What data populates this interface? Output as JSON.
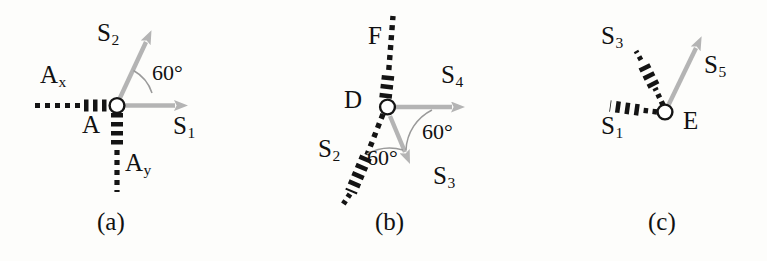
{
  "figure": {
    "background_color": "#fdfdfb",
    "arrow_color": "#b4b4b4",
    "dash_color": "#141414",
    "text_color": "#111111"
  },
  "panels": [
    {
      "id": "a",
      "caption": "(a)",
      "joint_label": "A",
      "angle_label": "60°",
      "members": [
        {
          "name": "S",
          "sub": "1",
          "style": "solid-gray-arrow",
          "direction": "right"
        },
        {
          "name": "S",
          "sub": "2",
          "style": "solid-gray-arrow",
          "direction": "up-right-60"
        },
        {
          "name": "A",
          "sub": "x",
          "style": "dashed-black",
          "direction": "left"
        },
        {
          "name": "A",
          "sub": "y",
          "style": "dashed-black",
          "direction": "down"
        }
      ]
    },
    {
      "id": "b",
      "caption": "(b)",
      "joint_label": "D",
      "angle_label_1": "60°",
      "angle_label_2": "60°",
      "members": [
        {
          "name": "F",
          "sub": "",
          "style": "dashed-black",
          "direction": "up"
        },
        {
          "name": "S",
          "sub": "2",
          "style": "dashed-black",
          "direction": "down-left"
        },
        {
          "name": "S",
          "sub": "3",
          "style": "solid-gray-arrow",
          "direction": "down-right"
        },
        {
          "name": "S",
          "sub": "4",
          "style": "solid-gray-arrow",
          "direction": "right"
        }
      ]
    },
    {
      "id": "c",
      "caption": "(c)",
      "joint_label": "E",
      "members": [
        {
          "name": "S",
          "sub": "1",
          "style": "dashed-black",
          "direction": "left"
        },
        {
          "name": "S",
          "sub": "3",
          "style": "dashed-black",
          "direction": "up-left"
        },
        {
          "name": "S",
          "sub": "5",
          "style": "solid-gray-arrow",
          "direction": "up-right"
        }
      ]
    }
  ],
  "labels": {
    "a_S1_main": "S",
    "a_S1_sub": "1",
    "a_S2_main": "S",
    "a_S2_sub": "2",
    "a_Ax_main": "A",
    "a_Ax_sub": "x",
    "a_Ay_main": "A",
    "a_Ay_sub": "y",
    "a_A": "A",
    "a_angle": "60°",
    "a_caption": "(a)",
    "b_F": "F",
    "b_D": "D",
    "b_S2_main": "S",
    "b_S2_sub": "2",
    "b_S3_main": "S",
    "b_S3_sub": "3",
    "b_S4_main": "S",
    "b_S4_sub": "4",
    "b_angle1": "60°",
    "b_angle2": "60°",
    "b_caption": "(b)",
    "c_S1_main": "S",
    "c_S1_sub": "1",
    "c_S3_main": "S",
    "c_S3_sub": "3",
    "c_S5_main": "S",
    "c_S5_sub": "5",
    "c_E": "E",
    "c_caption": "(c)"
  }
}
